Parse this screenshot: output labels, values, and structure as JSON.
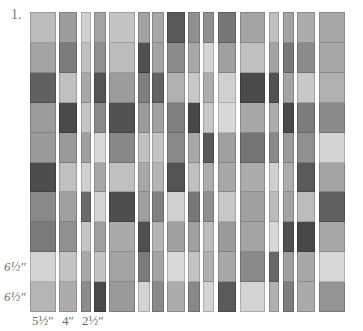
{
  "figure": {
    "number_label": "1.",
    "row_height_labels": [
      {
        "text": "6½″",
        "row": 9
      },
      {
        "text": "6½″",
        "row": 10
      }
    ],
    "column_width_labels": [
      {
        "text": "5½″",
        "col": 1
      },
      {
        "text": "4″",
        "col": 2
      },
      {
        "text": "2½″",
        "col": 3
      }
    ]
  },
  "strips": [
    {
      "x": 30,
      "w": 26,
      "cells": [
        "#bcbcbc",
        "#a4a4a4",
        "#606060",
        "#9c9c9c",
        "#9a9a9a",
        "#4c4c4c",
        "#8a8a8a",
        "#7a7a7a",
        "#d4d4d4",
        "#b4b4b4"
      ]
    },
    {
      "x": 59,
      "w": 18,
      "cells": [
        "#9c9c9c",
        "#7c7c7c",
        "#c0c0c0",
        "#4a4a4a",
        "#9a9a9a",
        "#c0c0c0",
        "#a0a0a0",
        "#909090",
        "#c4c4c4",
        "#acacac"
      ]
    },
    {
      "x": 81,
      "w": 10,
      "cells": [
        "#d0d0d0",
        "#c0c0c0",
        "#a8a8a8",
        "#c4c4c4",
        "#a0a0a0",
        "#d0d0d0",
        "#6a6a6a",
        "#c4c4c4",
        "#a8a8a8",
        "#8c8c8c"
      ]
    },
    {
      "x": 94,
      "w": 12,
      "cells": [
        "#a4a4a4",
        "#909090",
        "#545454",
        "#8a8a8a",
        "#d8d8d8",
        "#a8a8a8",
        "#d4d4d4",
        "#a0a0a0",
        "#c4c4c4",
        "#4a4a4a"
      ]
    },
    {
      "x": 109,
      "w": 26,
      "cells": [
        "#c4c4c4",
        "#bcbcbc",
        "#9c9c9c",
        "#525252",
        "#888888",
        "#c0c0c0",
        "#4e4e4e",
        "#aaaaaa",
        "#a4a4a4",
        "#9a9a9a"
      ]
    },
    {
      "x": 138,
      "w": 12,
      "cells": [
        "#a4a4a4",
        "#505050",
        "#808080",
        "#9a9a9a",
        "#c0c0c0",
        "#a8a8a8",
        "#a0a0a0",
        "#505050",
        "#7c7c7c",
        "#d4d4d4"
      ]
    },
    {
      "x": 152,
      "w": 12,
      "cells": [
        "#a8a8a8",
        "#a4a4a4",
        "#626262",
        "#a0a0a0",
        "#c4c4c4",
        "#b4b4b4",
        "#808080",
        "#b4b4b4",
        "#a4a4a4",
        "#8a8a8a"
      ]
    },
    {
      "x": 167,
      "w": 18,
      "cells": [
        "#585858",
        "#8c8c8c",
        "#b0b0b0",
        "#808080",
        "#8a8a8a",
        "#545454",
        "#d0d0d0",
        "#a0a0a0",
        "#dadada",
        "#acacac"
      ]
    },
    {
      "x": 188,
      "w": 12,
      "cells": [
        "#909090",
        "#a8a8a8",
        "#c8c8c8",
        "#484848",
        "#a8a8a8",
        "#c0c0c0",
        "#787878",
        "#a0a0a0",
        "#c4c4c4",
        "#888888"
      ]
    },
    {
      "x": 203,
      "w": 11,
      "cells": [
        "#909090",
        "#d4d4d4",
        "#acacac",
        "#c8c8c8",
        "#5a5a5a",
        "#acacac",
        "#909090",
        "#bcbcbc",
        "#b0b0b0",
        "#d4d4d4"
      ]
    },
    {
      "x": 218,
      "w": 18,
      "cells": [
        "#767676",
        "#a0a0a0",
        "#d0d0d0",
        "#d8d8d8",
        "#a0a0a0",
        "#a8a8a8",
        "#c8c8c8",
        "#9a9a9a",
        "#a8a8a8",
        "#5a5a5a"
      ]
    },
    {
      "x": 240,
      "w": 25,
      "cells": [
        "#a4a4a4",
        "#c0c0c0",
        "#4a4a4a",
        "#a8a8a8",
        "#747474",
        "#acacac",
        "#a0a0a0",
        "#a4a4a4",
        "#8a8a8a",
        "#d4d4d4"
      ]
    },
    {
      "x": 269,
      "w": 10,
      "cells": [
        "#c0c0c0",
        "#a4a4a4",
        "#525252",
        "#acacac",
        "#8a8a8a",
        "#d0d0d0",
        "#bcbcbc",
        "#d8d8d8",
        "#686868",
        "#b0b0b0"
      ]
    },
    {
      "x": 283,
      "w": 11,
      "cells": [
        "#a4a4a4",
        "#787878",
        "#a4a4a4",
        "#4a4a4a",
        "#9a9a9a",
        "#acacac",
        "#a4a4a4",
        "#505050",
        "#a0a0a0",
        "#7e7e7e"
      ]
    },
    {
      "x": 297,
      "w": 18,
      "cells": [
        "#acacac",
        "#8c8c8c",
        "#c8c8c8",
        "#7c7c7c",
        "#909090",
        "#5a5a5a",
        "#bcbcbc",
        "#484848",
        "#a8a8a8",
        "#aaaaaa"
      ]
    },
    {
      "x": 319,
      "w": 26,
      "cells": [
        "#a8a8a8",
        "#a8a8a8",
        "#b0b0b0",
        "#8a8a8a",
        "#d4d4d4",
        "#a4a4a4",
        "#606060",
        "#a8a8a8",
        "#d8d8d8",
        "#949494"
      ]
    }
  ]
}
